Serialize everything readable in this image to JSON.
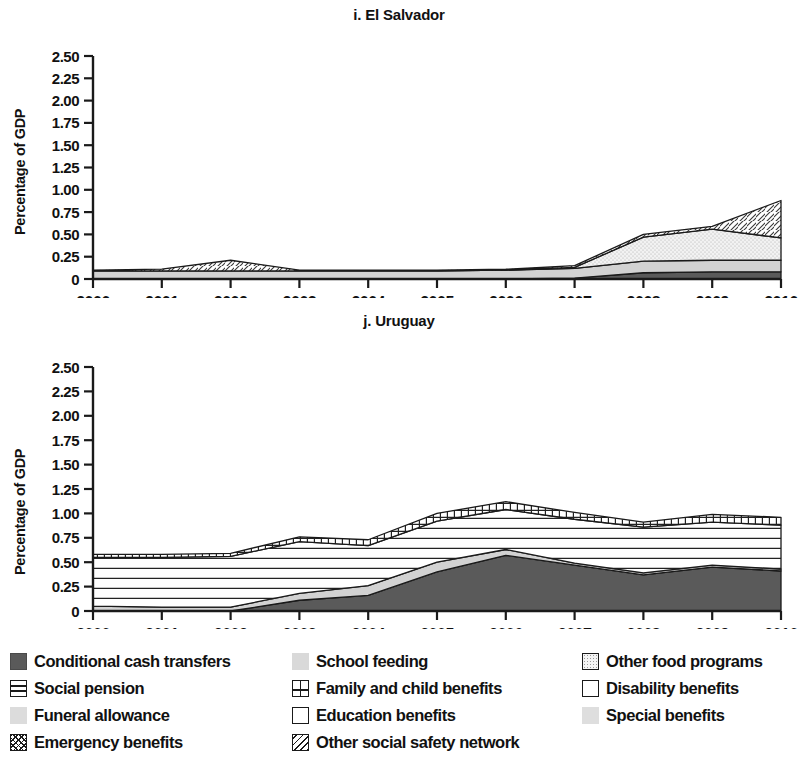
{
  "panels": [
    {
      "title": "i. El Salvador",
      "ylabel": "Percentage of GDP"
    },
    {
      "title": "j. Uruguay",
      "ylabel": "Percentage of GDP"
    }
  ],
  "legend": {
    "rows": [
      [
        {
          "label": "Conditional cash transfers",
          "pattern": "solid-dark",
          "color": "#5a5a5a"
        },
        {
          "label": "School feeding",
          "pattern": "solid-light",
          "color": "#d9d9d9"
        },
        {
          "label": "Other food programs",
          "pattern": "stipple",
          "color": "#ececec"
        }
      ],
      [
        {
          "label": "Social pension",
          "pattern": "horizontal-lines",
          "color": "#ffffff"
        },
        {
          "label": "Family and child benefits",
          "pattern": "grid",
          "color": "#ffffff"
        },
        {
          "label": "Disability benefits",
          "pattern": "empty",
          "color": "#ffffff"
        }
      ],
      [
        {
          "label": "Funeral allowance",
          "pattern": "solid-lighter",
          "color": "#dcdcdc"
        },
        {
          "label": "Education benefits",
          "pattern": "empty",
          "color": "#ffffff"
        },
        {
          "label": "Special benefits",
          "pattern": "solid-lighter2",
          "color": "#dedede"
        }
      ],
      [
        {
          "label": "Emergency benefits",
          "pattern": "crosshatch",
          "color": "#ffffff"
        },
        {
          "label": "Other social safety network",
          "pattern": "diagonal",
          "color": "#ffffff"
        }
      ]
    ]
  },
  "chart_data": [
    {
      "type": "area",
      "title": "i. El Salvador",
      "xlabel": "",
      "ylabel": "Percentage of GDP",
      "ylim": [
        0,
        2.5
      ],
      "yticks": [
        "0",
        "0.25",
        "0.50",
        "0.75",
        "1.00",
        "1.25",
        "1.50",
        "1.75",
        "2.00",
        "2.25",
        "2.50"
      ],
      "grid": false,
      "legend_position": "below-figure",
      "categories": [
        "2000",
        "2001",
        "2002",
        "2003",
        "2004",
        "2005",
        "2006",
        "2007",
        "2008",
        "2009",
        "2010"
      ],
      "x": [
        2000,
        2001,
        2002,
        2003,
        2004,
        2005,
        2006,
        2007,
        2008,
        2009,
        2010
      ],
      "series": [
        {
          "name": "Conditional cash transfers",
          "values": [
            0,
            0,
            0,
            0,
            0,
            0,
            0,
            0.01,
            0.07,
            0.08,
            0.08
          ]
        },
        {
          "name": "School feeding",
          "values": [
            0.09,
            0.09,
            0.09,
            0.09,
            0.09,
            0.09,
            0.1,
            0.11,
            0.13,
            0.13,
            0.13
          ]
        },
        {
          "name": "Other food programs",
          "values": [
            0,
            0,
            0,
            0,
            0,
            0,
            0,
            0.01,
            0.27,
            0.35,
            0.25
          ]
        },
        {
          "name": "Other social safety network",
          "values": [
            0.01,
            0.02,
            0.12,
            0.01,
            0.01,
            0.01,
            0.01,
            0.02,
            0.03,
            0.03,
            0.42
          ]
        }
      ],
      "totals": [
        0.1,
        0.11,
        0.21,
        0.1,
        0.1,
        0.1,
        0.11,
        0.15,
        0.5,
        0.59,
        0.88
      ]
    },
    {
      "type": "area",
      "title": "j. Uruguay",
      "xlabel": "",
      "ylabel": "Percentage of GDP",
      "ylim": [
        0,
        2.5
      ],
      "yticks": [
        "0",
        "0.25",
        "0.50",
        "0.75",
        "1.00",
        "1.25",
        "1.50",
        "1.75",
        "2.00",
        "2.25",
        "2.50"
      ],
      "grid": false,
      "legend_position": "below-figure",
      "categories": [
        "2000",
        "2001",
        "2002",
        "2003",
        "2004",
        "2005",
        "2006",
        "2007",
        "2008",
        "2009",
        "2010"
      ],
      "x": [
        2000,
        2001,
        2002,
        2003,
        2004,
        2005,
        2006,
        2007,
        2008,
        2009,
        2010
      ],
      "series": [
        {
          "name": "Conditional cash transfers",
          "values": [
            0.0,
            0.0,
            0.0,
            0.11,
            0.16,
            0.4,
            0.57,
            0.47,
            0.37,
            0.45,
            0.41
          ]
        },
        {
          "name": "School feeding",
          "values": [
            0.05,
            0.04,
            0.04,
            0.07,
            0.1,
            0.1,
            0.06,
            0.02,
            0.02,
            0.02,
            0.02
          ]
        },
        {
          "name": "Social pension",
          "values": [
            0.5,
            0.51,
            0.52,
            0.53,
            0.41,
            0.42,
            0.41,
            0.45,
            0.47,
            0.44,
            0.45
          ]
        },
        {
          "name": "Family and child benefits",
          "values": [
            0.03,
            0.03,
            0.03,
            0.05,
            0.06,
            0.08,
            0.08,
            0.07,
            0.05,
            0.08,
            0.08
          ]
        }
      ],
      "totals": [
        0.58,
        0.58,
        0.59,
        0.76,
        0.73,
        1.0,
        1.12,
        1.01,
        0.91,
        0.99,
        0.96
      ]
    }
  ]
}
